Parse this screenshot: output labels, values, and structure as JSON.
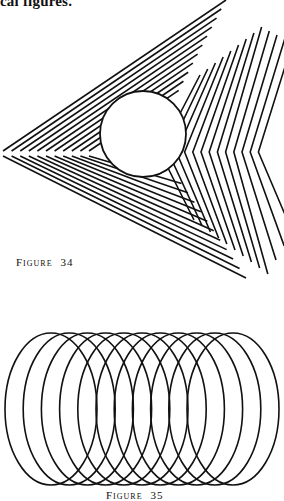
{
  "page": {
    "header_fragment": "cal figures.",
    "ink_color": "#111111",
    "background": "#ffffff"
  },
  "figures": [
    {
      "id": "figure-34",
      "caption_label": "Figure",
      "caption_number": "34",
      "description": "Nested triangular chevron lines with a circle overlay",
      "line_count_per_arm": 11,
      "circle": {
        "cx": 143,
        "cy": 134,
        "r": 43
      }
    },
    {
      "id": "figure-35",
      "caption_label": "Figure",
      "caption_number": "35",
      "description": "Eleven overlapping equal ellipses offset horizontally",
      "ellipse_count": 11,
      "ellipse": {
        "rx": 46,
        "ry": 76,
        "cy": 409,
        "cx_start": 51,
        "cx_step": 18.2
      }
    }
  ]
}
